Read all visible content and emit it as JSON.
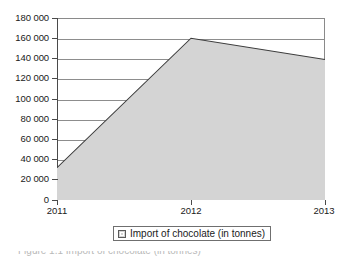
{
  "chart_data": {
    "type": "area",
    "title": "",
    "subtitle": "",
    "xlabel": "",
    "ylabel": "",
    "categories": [
      "2011",
      "2012",
      "2013"
    ],
    "x": [
      2011,
      2012,
      2013
    ],
    "series": [
      {
        "name": "Import of chocolate (in tonnes)",
        "values": [
          32000,
          160000,
          139000
        ]
      }
    ],
    "ylim": [
      0,
      180000
    ],
    "ytick_values": [
      0,
      20000,
      40000,
      60000,
      80000,
      100000,
      120000,
      140000,
      160000,
      180000
    ],
    "ytick_labels": [
      "0",
      "20 000",
      "40 000",
      "60 000",
      "80 000",
      "100 000",
      "120 000",
      "140 000",
      "160 000",
      "180 000"
    ],
    "xtick_labels": [
      "2011",
      "2012",
      "2013"
    ],
    "grid": "horizontal",
    "legend_position": "bottom-center",
    "legend_entries": [
      "Import of chocolate (in tonnes)"
    ],
    "colors": {
      "area_fill": "#d4d4d4",
      "area_line": "#3c3c3c",
      "gridline": "#8d8d8d",
      "axis": "#4a4a4a",
      "text": "#1a1a1a",
      "background": "#ffffff"
    }
  },
  "legend": {
    "label": "Import of chocolate (in tonnes)",
    "swatch_icon": "legend-square-icon"
  },
  "caption": {
    "text": "Figure 1.1 Import of chocolate (in tonnes)"
  }
}
